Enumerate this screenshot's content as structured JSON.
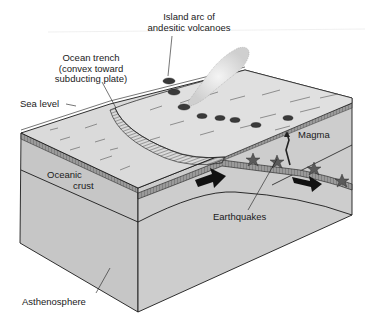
{
  "diagram": {
    "type": "block-diagram",
    "labels": {
      "island_arc_line1": "Island arc of",
      "island_arc_line2": "andesitic volcanoes",
      "trench_line1": "Ocean trench",
      "trench_line2": "(convex toward",
      "trench_line3": "subducting plate)",
      "sea_level": "Sea level",
      "magma": "Magma",
      "oceanic_line1": "Oceanic",
      "oceanic_line2": "crust",
      "earthquakes": "Earthquakes",
      "asthenosphere": "Asthenosphere"
    },
    "colors": {
      "background": "#ffffff",
      "top_surface": "#d9d9d9",
      "front_face": "#c4c4c4",
      "side_face": "#cfcfcf",
      "outline": "#1a1a1a",
      "arrow": "#111111",
      "star": "#555555"
    },
    "features": [
      "volcanoes",
      "ash plume",
      "trench",
      "subducting slab",
      "motion arrows",
      "earthquake foci",
      "magma conduit"
    ]
  }
}
